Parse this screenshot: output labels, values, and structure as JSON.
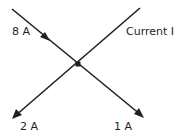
{
  "diagram": {
    "stroke_color": "#231f20",
    "junction": {
      "x": 78,
      "y": 64
    },
    "branches": [
      {
        "id": "in-8A",
        "label": "8 A",
        "direction": "into-junction",
        "from": [
          12,
          9
        ],
        "to": [
          78,
          64
        ]
      },
      {
        "id": "current-I",
        "label": "Current I",
        "direction": "unknown",
        "from": [
          140,
          8
        ],
        "to": [
          78,
          64
        ]
      },
      {
        "id": "out-2A",
        "label": "2 A",
        "direction": "out-of-junction",
        "from": [
          78,
          64
        ],
        "to": [
          13,
          118
        ]
      },
      {
        "id": "out-1A",
        "label": "1 A",
        "direction": "out-of-junction",
        "from": [
          78,
          64
        ],
        "to": [
          143,
          117
        ]
      }
    ]
  },
  "labels": {
    "in_8A": "8 A",
    "current_I": "Current I",
    "out_2A": "2 A",
    "out_1A": "1 A"
  }
}
